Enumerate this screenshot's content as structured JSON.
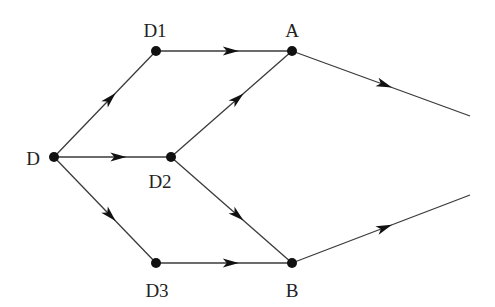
{
  "diagram": {
    "type": "directed-graph",
    "colors": {
      "edge": "#3a3a3a",
      "node": "#111111",
      "background": "#ffffff"
    },
    "nodes": [
      {
        "id": "D",
        "label": "D",
        "x": 54,
        "y": 157,
        "label_x": 33,
        "label_y": 158
      },
      {
        "id": "D1",
        "label": "D1",
        "x": 156,
        "y": 51,
        "label_x": 155,
        "label_y": 30
      },
      {
        "id": "D2",
        "label": "D2",
        "x": 171,
        "y": 157,
        "label_x": 160,
        "label_y": 181
      },
      {
        "id": "D3",
        "label": "D3",
        "x": 156,
        "y": 263,
        "label_x": 157,
        "label_y": 290
      },
      {
        "id": "A",
        "label": "A",
        "x": 292,
        "y": 51,
        "label_x": 292,
        "label_y": 30
      },
      {
        "id": "B",
        "label": "B",
        "x": 292,
        "y": 263,
        "label_x": 292,
        "label_y": 290
      }
    ],
    "edges": [
      {
        "from": "D",
        "to": "D1"
      },
      {
        "from": "D",
        "to": "D2"
      },
      {
        "from": "D",
        "to": "D3"
      },
      {
        "from": "D1",
        "to": "A"
      },
      {
        "from": "D2",
        "to": "A"
      },
      {
        "from": "D2",
        "to": "B"
      },
      {
        "from": "D3",
        "to": "B"
      },
      {
        "from": "A",
        "to": "exit-A",
        "x2": 470,
        "y2": 116
      },
      {
        "from": "B",
        "to": "exit-B",
        "x2": 470,
        "y2": 195
      }
    ]
  }
}
